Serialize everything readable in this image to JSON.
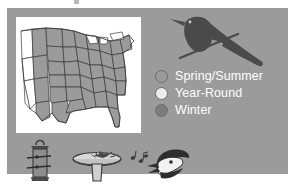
{
  "figure": {
    "name": "bird-range-map-figure",
    "panel_color": "#9b9b9b",
    "map_background": "#ffffff"
  },
  "map": {
    "name": "united-states-range-map",
    "range_fill": "#9b9b9b",
    "outline_color": "#3a3a3a",
    "description": "United States map with eastern and central states shaded"
  },
  "bird": {
    "name": "perched-blackbird-silhouette",
    "color": "#4a4a4a"
  },
  "legend": {
    "items": [
      {
        "label": "Spring/Summer",
        "swatch_color": "#9b9b9b",
        "icon": "circle-icon"
      },
      {
        "label": "Year-Round",
        "swatch_color": "#ebebeb",
        "icon": "circle-icon"
      },
      {
        "label": "Winter",
        "swatch_color": "#7c7c7c",
        "icon": "circle-icon"
      }
    ],
    "text_color": "#ffffff"
  },
  "bottom_icons": [
    {
      "name": "tube-feeder-icon",
      "label": "Tube feeder"
    },
    {
      "name": "bird-bath-icon",
      "label": "Bird bath"
    },
    {
      "name": "singing-bird-icon",
      "label": "Singing bird with music notes"
    }
  ]
}
